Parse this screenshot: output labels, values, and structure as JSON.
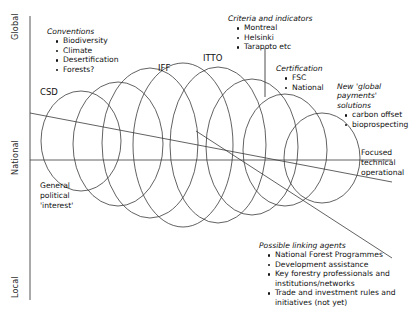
{
  "figure": {
    "type": "conceptual-funnel-diagram",
    "axis": {
      "name": "scale-axis",
      "labels": [
        "Global",
        "National",
        "Local"
      ],
      "orientation": "vertical"
    },
    "nodes": [
      {
        "id": "csd",
        "label": "CSD",
        "x": 40,
        "y": 92
      },
      {
        "id": "iff",
        "label": "IFF",
        "x": 158,
        "y": 68
      },
      {
        "id": "itto",
        "label": "ITTO",
        "x": 203,
        "y": 58
      }
    ],
    "annotations": {
      "conventions": {
        "heading": "Conventions",
        "items": [
          "Biodiversity",
          "Climate",
          "Desertification",
          "Forests?"
        ]
      },
      "criteria": {
        "heading": "Criteria and indicators",
        "items": [
          "Montreal",
          "Helsinki",
          "Tarapoto etc"
        ]
      },
      "certification": {
        "heading": "Certification",
        "items": [
          "FSC",
          "National"
        ]
      },
      "new_payments": {
        "heading": "New 'global\npayments'\nsolutions",
        "items": [
          "carbon offset",
          "bioprospecting"
        ]
      },
      "linking_agents": {
        "heading": "Possible linking agents",
        "items": [
          "National Forest Programmes",
          "Development assistance",
          "Key forestry professionals and\ninstitutions/networks",
          "Trade and investment rules and\ninitiatives (not yet)"
        ]
      },
      "general_political": "General\npolitical\n'interest'",
      "focused_technical": "Focused\ntechnical\noperational"
    },
    "colors": {
      "stroke": "#3a3a3a",
      "axis": "#555555",
      "text": "#111111",
      "background": "#ffffff"
    },
    "ellipses": [
      {
        "cx": 81,
        "cy": 141,
        "rx": 40,
        "ry": 50
      },
      {
        "cx": 118,
        "cy": 144,
        "rx": 45,
        "ry": 62
      },
      {
        "cx": 150,
        "cy": 143,
        "rx": 48,
        "ry": 75
      },
      {
        "cx": 183,
        "cy": 145,
        "rx": 50,
        "ry": 82
      },
      {
        "cx": 218,
        "cy": 145,
        "rx": 48,
        "ry": 78
      },
      {
        "cx": 252,
        "cy": 147,
        "rx": 46,
        "ry": 68
      },
      {
        "cx": 285,
        "cy": 150,
        "rx": 42,
        "ry": 56
      },
      {
        "cx": 322,
        "cy": 158,
        "rx": 38,
        "ry": 45
      }
    ],
    "guide_lines": [
      {
        "name": "national-horizontal",
        "x1": 30,
        "y1": 160,
        "x2": 392,
        "y2": 160
      },
      {
        "name": "upper-converging",
        "x1": 30,
        "y1": 113,
        "x2": 392,
        "y2": 182
      },
      {
        "name": "lower-converging",
        "x1": 196,
        "y1": 131,
        "x2": 392,
        "y2": 258
      }
    ]
  }
}
